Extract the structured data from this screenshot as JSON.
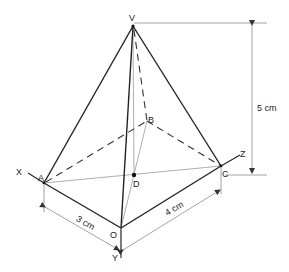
{
  "diagram": {
    "type": "pyramid-isometric",
    "points": {
      "V": {
        "label": "V"
      },
      "A": {
        "label": "A"
      },
      "B": {
        "label": "B"
      },
      "C": {
        "label": "C"
      },
      "D": {
        "label": "D"
      },
      "O": {
        "label": "O"
      }
    },
    "axes": {
      "x": {
        "label": "X"
      },
      "y": {
        "label": "Y"
      },
      "z": {
        "label": "Z"
      }
    },
    "dimensions": {
      "height": "5 cm",
      "oa": "3 cm",
      "oc": "4 cm"
    },
    "colors": {
      "line": "#222222",
      "dim_line": "#666666",
      "background": "#ffffff"
    }
  }
}
